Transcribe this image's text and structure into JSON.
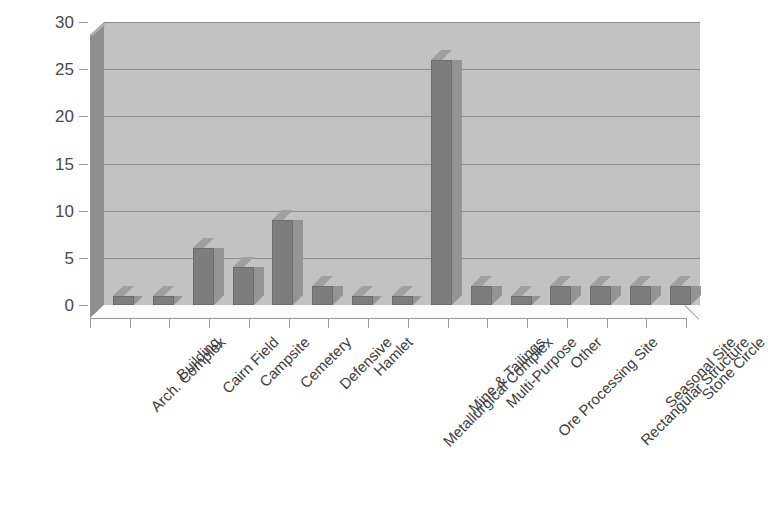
{
  "chart_data": {
    "type": "bar",
    "title": "",
    "subtitle": "",
    "xlabel": "",
    "ylabel": "",
    "ylim": [
      0,
      30
    ],
    "yticks": [
      0,
      5,
      10,
      15,
      20,
      25,
      30
    ],
    "grid": true,
    "legend": false,
    "legend_position": "none",
    "style": "3d-column",
    "categories": [
      "Arch. Complex",
      "Building",
      "Cairn Field",
      "Campsite",
      "Cemetery",
      "Defensive",
      "Hamlet",
      "Metallurgical Complex",
      "Mine & Tailings",
      "Multi-Purpose",
      "Ore Processing Site",
      "Other",
      "Rectangular Structure",
      "Seasonal Site",
      "Stone Circle"
    ],
    "values": [
      1,
      1,
      6,
      4,
      9,
      2,
      1,
      1,
      26,
      2,
      1,
      2,
      2,
      2,
      2
    ]
  },
  "colors": {
    "bar_front": "#7d7d7d",
    "bar_side": "#949494",
    "bar_top": "#a0a0a0",
    "plot_background": "#c2c2c2",
    "left_wall": "#8f8f8f",
    "floor": "#fbfbfb",
    "gridline": "#8d8d8d",
    "axis_text": "#4a4a4a",
    "label_text": "#3d3d3d",
    "page_background": "#ffffff"
  }
}
